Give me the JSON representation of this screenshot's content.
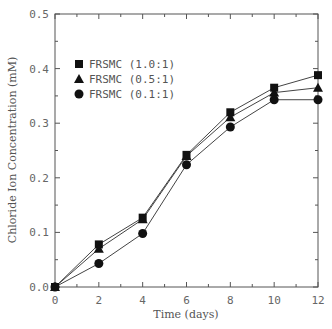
{
  "chart_data": {
    "type": "line",
    "title": "",
    "xlabel": "Time (days)",
    "ylabel": "Chloride Ion Concentration (mM)",
    "x": [
      0,
      2,
      4,
      6,
      8,
      10,
      12
    ],
    "xlim": [
      0,
      12
    ],
    "ylim": [
      0.0,
      0.5
    ],
    "xticks": [
      0,
      2,
      4,
      6,
      8,
      10,
      12
    ],
    "xtick_labels": [
      "0",
      "2",
      "4",
      "6",
      "8",
      "10",
      "12"
    ],
    "yticks": [
      0.0,
      0.1,
      0.2,
      0.3,
      0.4,
      0.5
    ],
    "ytick_labels": [
      "0.0",
      "0.1",
      "0.2",
      "0.3",
      "0.4",
      "0.5"
    ],
    "grid": false,
    "legend_position": "upper left",
    "series": [
      {
        "name": "FRSMC (1.0:1)",
        "marker": "square",
        "values": [
          0.0,
          0.078,
          0.127,
          0.242,
          0.32,
          0.365,
          0.388
        ]
      },
      {
        "name": "FRSMC (0.5:1)",
        "marker": "triangle",
        "values": [
          0.0,
          0.07,
          0.124,
          0.24,
          0.311,
          0.356,
          0.365
        ]
      },
      {
        "name": "FRSMC (0.1:1)",
        "marker": "circle",
        "values": [
          0.0,
          0.043,
          0.098,
          0.224,
          0.293,
          0.343,
          0.343
        ]
      }
    ]
  },
  "colors": {
    "line": "#444444",
    "marker": "#111111",
    "axis": "#555555"
  }
}
